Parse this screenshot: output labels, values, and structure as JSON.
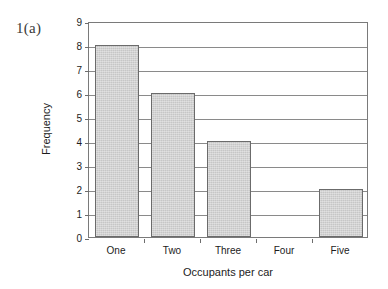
{
  "figure": {
    "label": "1(a)"
  },
  "chart_data": {
    "type": "bar",
    "title": "",
    "categories": [
      "One",
      "Two",
      "Three",
      "Four",
      "Five"
    ],
    "values": [
      8,
      6,
      4,
      0,
      2
    ],
    "xlabel": "Occupants per car",
    "ylabel": "Frequency",
    "ylim": [
      0,
      9
    ],
    "ytick_labels": [
      "0",
      "1",
      "2",
      "3",
      "4",
      "5",
      "6",
      "7",
      "8",
      "9"
    ],
    "ytick_values": [
      0,
      1,
      2,
      3,
      4,
      5,
      6,
      7,
      8,
      9
    ],
    "grid": "horizontal",
    "legend": "none",
    "bar_fill_color": "#c6c6c6",
    "bar_edge_color": "#6b6b6b",
    "axis_color": "#7a7a7a",
    "background_color": "#ffffff"
  }
}
